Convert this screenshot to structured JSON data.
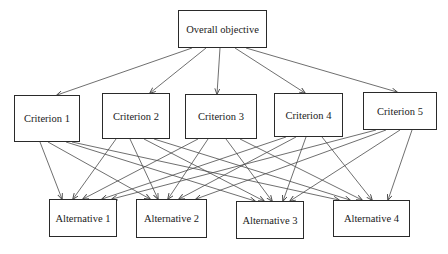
{
  "diagram": {
    "type": "hierarchy",
    "levels": [
      "goal",
      "criteria",
      "alternatives"
    ],
    "goal": {
      "label": "Overall objective",
      "box": [
        178,
        10,
        89,
        38
      ]
    },
    "criteria": [
      {
        "label": "Criterion 1",
        "box": [
          14,
          95,
          66,
          47
        ]
      },
      {
        "label": "Criterion 2",
        "box": [
          102,
          93,
          68,
          46
        ]
      },
      {
        "label": "Criterion 3",
        "box": [
          185,
          94,
          72,
          45
        ]
      },
      {
        "label": "Criterion 4",
        "box": [
          274,
          93,
          69,
          44
        ]
      },
      {
        "label": "Criterion 5",
        "box": [
          363,
          92,
          74,
          38
        ]
      }
    ],
    "alternatives": [
      {
        "label": "Alternative 1",
        "box": [
          49,
          199,
          68,
          38
        ]
      },
      {
        "label": "Alternative 2",
        "box": [
          136,
          199,
          71,
          39
        ]
      },
      {
        "label": "Alternative 3",
        "box": [
          236,
          201,
          68,
          38
        ]
      },
      {
        "label": "Alternative 4",
        "box": [
          333,
          200,
          77,
          37
        ]
      }
    ],
    "edges_goal_to_criteria": [
      {
        "from": [
          192,
          48
        ],
        "to": [
          57,
          95
        ]
      },
      {
        "from": [
          206,
          48
        ],
        "to": [
          150,
          93
        ]
      },
      {
        "from": [
          220,
          48
        ],
        "to": [
          217,
          94
        ]
      },
      {
        "from": [
          235,
          48
        ],
        "to": [
          305,
          93
        ]
      },
      {
        "from": [
          246,
          48
        ],
        "to": [
          397,
          92
        ]
      }
    ],
    "edges_criteria_to_alternatives": [
      {
        "from": [
          40,
          142
        ],
        "to": [
          62,
          199
        ]
      },
      {
        "from": [
          48,
          142
        ],
        "to": [
          150,
          199
        ]
      },
      {
        "from": [
          66,
          142
        ],
        "to": [
          255,
          201
        ]
      },
      {
        "from": [
          72,
          142
        ],
        "to": [
          339,
          200
        ]
      },
      {
        "from": [
          116,
          139
        ],
        "to": [
          73,
          199
        ]
      },
      {
        "from": [
          130,
          139
        ],
        "to": [
          158,
          199
        ]
      },
      {
        "from": [
          144,
          139
        ],
        "to": [
          264,
          201
        ]
      },
      {
        "from": [
          154,
          139
        ],
        "to": [
          350,
          200
        ]
      },
      {
        "from": [
          198,
          139
        ],
        "to": [
          83,
          199
        ]
      },
      {
        "from": [
          208,
          139
        ],
        "to": [
          168,
          199
        ]
      },
      {
        "from": [
          226,
          139
        ],
        "to": [
          272,
          201
        ]
      },
      {
        "from": [
          240,
          139
        ],
        "to": [
          362,
          200
        ]
      },
      {
        "from": [
          286,
          137
        ],
        "to": [
          102,
          199
        ]
      },
      {
        "from": [
          296,
          137
        ],
        "to": [
          179,
          199
        ]
      },
      {
        "from": [
          306,
          137
        ],
        "to": [
          283,
          201
        ]
      },
      {
        "from": [
          322,
          137
        ],
        "to": [
          372,
          200
        ]
      },
      {
        "from": [
          376,
          130
        ],
        "to": [
          112,
          199
        ]
      },
      {
        "from": [
          386,
          130
        ],
        "to": [
          196,
          199
        ]
      },
      {
        "from": [
          400,
          130
        ],
        "to": [
          290,
          201
        ]
      },
      {
        "from": [
          412,
          130
        ],
        "to": [
          388,
          200
        ]
      }
    ],
    "colors": {
      "line": "#4a4a4a",
      "border": "#2a2a2a",
      "text": "#1a1a1a",
      "background": "#ffffff"
    }
  }
}
